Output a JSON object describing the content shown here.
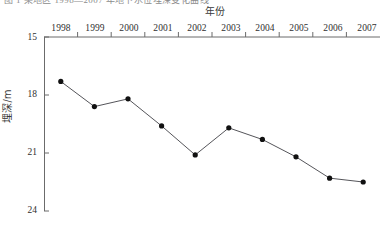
{
  "caption_sliver": "图 1  某地区 1998—2007 年地下水位埋深变化曲线",
  "axis_titles": {
    "x": "年份",
    "y": "埋深/m"
  },
  "y_ticks": [
    "15",
    "18",
    "21",
    "24"
  ],
  "x_ticks": [
    "1998",
    "1999",
    "2000",
    "2001",
    "2002",
    "2003",
    "2004",
    "2005",
    "2006",
    "2007"
  ],
  "style": {
    "line_color": "#55555a",
    "marker_color": "#111111",
    "axis_color": "#6b6b6b",
    "text_color": "#2f2f2f",
    "background": "#ffffff"
  },
  "chart_data": {
    "type": "line",
    "title": "",
    "subtitle": "",
    "xlabel": "年份",
    "ylabel": "埋深/m",
    "categories": [
      "1998",
      "1999",
      "2000",
      "2001",
      "2002",
      "2003",
      "2004",
      "2005",
      "2006",
      "2007"
    ],
    "x": [
      1998,
      1999,
      2000,
      2001,
      2002,
      2003,
      2004,
      2005,
      2006,
      2007
    ],
    "values": [
      17.3,
      18.6,
      18.2,
      19.6,
      21.1,
      19.7,
      20.3,
      21.2,
      22.3,
      22.5
    ],
    "series": [
      {
        "name": "地下水位埋深",
        "values": [
          17.3,
          18.6,
          18.2,
          19.6,
          21.1,
          19.7,
          20.3,
          21.2,
          22.3,
          22.5
        ]
      }
    ],
    "ylim": [
      15,
      24
    ],
    "y_inverted": true,
    "y_ticks": [
      15,
      18,
      21,
      24
    ],
    "xlim": [
      1997.5,
      2007.5
    ],
    "grid": false,
    "legend": false,
    "legend_position": "none",
    "x_axis_position": "top",
    "markers": "filled-circle",
    "annotations": []
  }
}
